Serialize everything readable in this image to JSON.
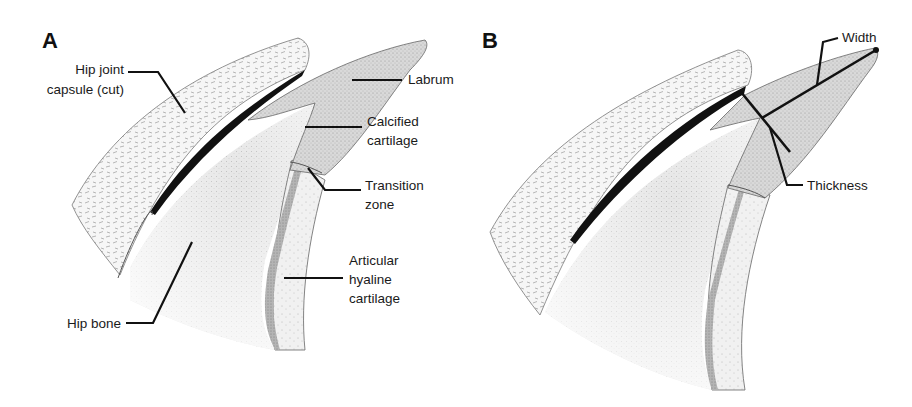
{
  "figure": {
    "panels": [
      {
        "id": "A",
        "letter": "A",
        "labels": {
          "capsule_line1": "Hip joint",
          "capsule_line2": "capsule (cut)",
          "labrum": "Labrum",
          "calcified_line1": "Calcified",
          "calcified_line2": "cartilage",
          "transition_line1": "Transition",
          "transition_line2": "zone",
          "articular_line1": "Articular",
          "articular_line2": "hyaline",
          "articular_line3": "cartilage",
          "hip_bone": "Hip bone"
        }
      },
      {
        "id": "B",
        "letter": "B",
        "labels": {
          "width": "Width",
          "thickness": "Thickness"
        }
      }
    ],
    "colors": {
      "background": "#ffffff",
      "capsule_fill": "#f4f4f4",
      "labrum_fill": "#d6d6d6",
      "bone_fill": "#e2e2e2",
      "calcified_band": "#a8a8a8",
      "hyaline_fill": "#ececec",
      "synovial_line": "#111111",
      "text": "#1a1a1a"
    }
  }
}
